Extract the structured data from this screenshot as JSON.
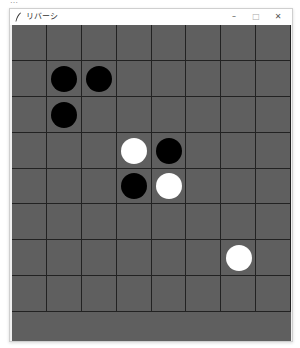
{
  "top_strip": {
    "text": "…"
  },
  "window": {
    "title": "リバーシ",
    "icon": "feather-icon",
    "controls": {
      "minimize": "–",
      "maximize": "□",
      "close": "✕"
    }
  },
  "board": {
    "rows": 8,
    "cols": 8,
    "background_color": "#5f5f5f",
    "line_color": "#222222",
    "colors": {
      "black": "#000000",
      "white": "#ffffff"
    },
    "pieces": [
      {
        "row": 1,
        "col": 1,
        "color": "black"
      },
      {
        "row": 1,
        "col": 2,
        "color": "black"
      },
      {
        "row": 2,
        "col": 1,
        "color": "black"
      },
      {
        "row": 3,
        "col": 3,
        "color": "white"
      },
      {
        "row": 3,
        "col": 4,
        "color": "black"
      },
      {
        "row": 4,
        "col": 3,
        "color": "black"
      },
      {
        "row": 4,
        "col": 4,
        "color": "white"
      },
      {
        "row": 6,
        "col": 6,
        "color": "white"
      }
    ]
  }
}
